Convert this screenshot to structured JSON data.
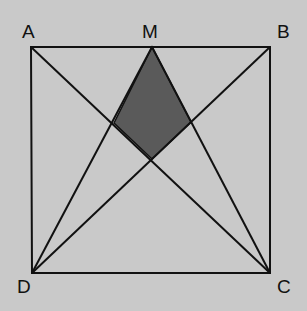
{
  "diagram": {
    "background": "#c9c9c9",
    "line_color": "#111111",
    "shade_color": "#5a5a5a",
    "points": {
      "A": {
        "label": "A",
        "x": 31,
        "y": 47
      },
      "M": {
        "label": "M",
        "x": 152,
        "y": 47
      },
      "B": {
        "label": "B",
        "x": 270,
        "y": 47
      },
      "C": {
        "label": "C",
        "x": 270,
        "y": 273
      },
      "D": {
        "label": "D",
        "x": 32,
        "y": 273
      }
    },
    "segments": [
      "AB",
      "BC",
      "CD",
      "DA",
      "AC",
      "BD",
      "MD",
      "MC"
    ],
    "shaded_region": "M, AC∩DM, AC∩BD, BD∩CM"
  }
}
